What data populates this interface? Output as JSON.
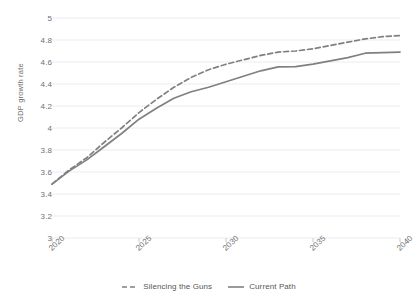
{
  "chart_data": {
    "type": "line",
    "title": "",
    "xlabel": "",
    "ylabel": "GDP growth rate",
    "xlim": [
      2020,
      2040
    ],
    "ylim": [
      3,
      5
    ],
    "grid": "horizontal",
    "legend_position": "bottom",
    "x_tick_labels": [
      "2020",
      "2025",
      "2030",
      "2035",
      "2040"
    ],
    "x_ticks": [
      2020,
      2025,
      2030,
      2035,
      2040
    ],
    "y_tick_labels": [
      "5",
      "4.8",
      "4.6",
      "4.4",
      "4.2",
      "4",
      "3.8",
      "3.6",
      "3.4",
      "3.2",
      "3"
    ],
    "y_ticks": [
      5,
      4.8,
      4.6,
      4.4,
      4.2,
      4,
      3.8,
      3.6,
      3.4,
      3.2,
      3
    ],
    "x": [
      2020,
      2021,
      2022,
      2023,
      2024,
      2025,
      2026,
      2027,
      2028,
      2029,
      2030,
      2031,
      2032,
      2033,
      2034,
      2035,
      2036,
      2037,
      2038,
      2039,
      2040
    ],
    "series": [
      {
        "name": "Silencing the Guns",
        "style": "dashed",
        "color": "#808080",
        "values": [
          3.49,
          3.62,
          3.73,
          3.87,
          4.0,
          4.14,
          4.26,
          4.37,
          4.46,
          4.53,
          4.58,
          4.62,
          4.66,
          4.69,
          4.7,
          4.72,
          4.75,
          4.78,
          4.81,
          4.83,
          4.84
        ]
      },
      {
        "name": "Current Path",
        "style": "solid",
        "color": "#808080",
        "values": [
          3.49,
          3.61,
          3.71,
          3.83,
          3.95,
          4.08,
          4.18,
          4.27,
          4.33,
          4.37,
          4.42,
          4.47,
          4.52,
          4.555,
          4.558,
          4.58,
          4.61,
          4.64,
          4.68,
          4.685,
          4.69
        ]
      }
    ]
  },
  "legend": {
    "items": [
      {
        "label": "Silencing the Guns",
        "style": "dashed"
      },
      {
        "label": "Current Path",
        "style": "solid"
      }
    ]
  },
  "colors": {
    "line": "#808080",
    "grid": "#ececf0",
    "tick_text": "#6f6f74",
    "legend_text": "#575757",
    "background": "#ffffff"
  }
}
